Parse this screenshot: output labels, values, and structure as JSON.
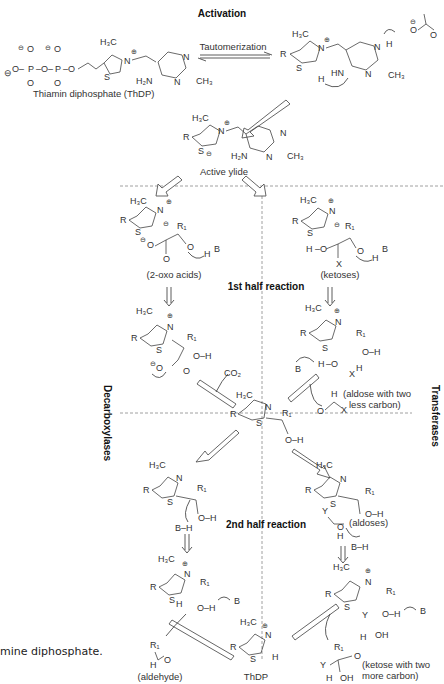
{
  "title": "Activation",
  "steps": {
    "tautomerization": "Tautomerization",
    "thdp_label": "Thiamin diphosphate (ThDP)",
    "active_ylide": "Active ylide",
    "first_half": "1st half reaction",
    "second_half": "2nd half reaction"
  },
  "side_labels": {
    "left": "Decarboxylases",
    "right": "Transferases"
  },
  "substrates": {
    "oxo_acids": "(2-oxo acids)",
    "ketoses": "(ketoses)",
    "aldose_less_1": "(aldose with two",
    "aldose_less_2": "less carbon)",
    "co2": "CO₂",
    "aldoses": "(aldoses)",
    "aldehyde": "(aldehyde)",
    "thdp": "ThDP",
    "ketose_more_1": "(ketose with two",
    "ketose_more_2": "more carbon)"
  },
  "atoms": {
    "h3c": "H₃C",
    "n": "N",
    "s": "S",
    "r": "R",
    "r1": "R₁",
    "ch3": "CH₃",
    "h2n": "H₂N",
    "hn": "HN",
    "oh": "O–H",
    "b": "B",
    "bh": "B–H",
    "h": "H",
    "o": "O",
    "x": "X",
    "y": "Y",
    "p": "P",
    "plus": "⊕",
    "minus": "⊖"
  },
  "caption": "mine diphosphate."
}
